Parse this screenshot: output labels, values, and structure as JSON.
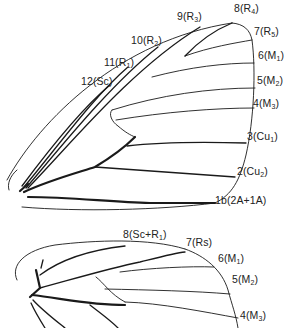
{
  "forewing": {
    "labels": [
      {
        "id": "v9",
        "num": "9(R",
        "sub": "3",
        "close": ")",
        "x": 177,
        "y": 17
      },
      {
        "id": "v8",
        "num": "8(R",
        "sub": "4",
        "close": ")",
        "x": 234,
        "y": 9
      },
      {
        "id": "v7",
        "num": "7(R",
        "sub": "5",
        "close": ")",
        "x": 254,
        "y": 32
      },
      {
        "id": "v10",
        "num": "10(R",
        "sub": "2",
        "close": ")",
        "x": 131,
        "y": 41
      },
      {
        "id": "v6",
        "num": "6(M",
        "sub": "1",
        "close": ")",
        "x": 258,
        "y": 56
      },
      {
        "id": "v11",
        "num": "11(R",
        "sub": "1",
        "close": ")",
        "x": 104,
        "y": 63
      },
      {
        "id": "v12",
        "num": "12(Sc)",
        "sub": "",
        "close": "",
        "x": 81,
        "y": 82
      },
      {
        "id": "v5",
        "num": "5(M",
        "sub": "2",
        "close": ")",
        "x": 257,
        "y": 81
      },
      {
        "id": "v4",
        "num": "4(M",
        "sub": "3",
        "close": ")",
        "x": 253,
        "y": 104
      },
      {
        "id": "v3",
        "num": "3(Cu",
        "sub": "1",
        "close": ")",
        "x": 247,
        "y": 137
      },
      {
        "id": "v2",
        "num": "2(Cu",
        "sub": "2",
        "close": ")",
        "x": 237,
        "y": 172
      },
      {
        "id": "v1b",
        "num": "1b(2A+1A)",
        "sub": "",
        "close": "",
        "x": 215,
        "y": 201
      }
    ]
  },
  "hindwing": {
    "labels": [
      {
        "id": "h8",
        "num": "8(Sc+R",
        "sub": "1",
        "close": ")",
        "x": 123,
        "y": 235
      },
      {
        "id": "h7",
        "num": "7(Rs)",
        "sub": "",
        "close": "",
        "x": 186,
        "y": 243
      },
      {
        "id": "h6",
        "num": "6(M",
        "sub": "1",
        "close": ")",
        "x": 218,
        "y": 259
      },
      {
        "id": "h5",
        "num": "5(M",
        "sub": "2",
        "close": ")",
        "x": 232,
        "y": 280
      },
      {
        "id": "h4",
        "num": "4(M",
        "sub": "3",
        "close": ")",
        "x": 240,
        "y": 316
      }
    ]
  }
}
